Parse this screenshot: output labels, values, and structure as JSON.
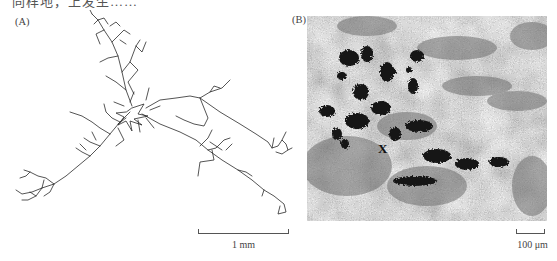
{
  "figure": {
    "top_caption_fragment": "同样地，上发生……",
    "panels": [
      {
        "id": "A",
        "label": "(A)",
        "content": "neuron arbor tracing",
        "scale_bar": {
          "label": "1 mm"
        }
      },
      {
        "id": "B",
        "label": "(B)",
        "content": "grayscale micrograph with dark stained clusters",
        "marker": "X",
        "scale_bar": {
          "label": "100 μm"
        }
      }
    ]
  },
  "colors": {
    "background": "#ffffff",
    "trace": "#2a2a2a",
    "micrograph_dark": "#7a7a7a",
    "micrograph_light": "#e8e8e8",
    "stain": "#151515"
  }
}
